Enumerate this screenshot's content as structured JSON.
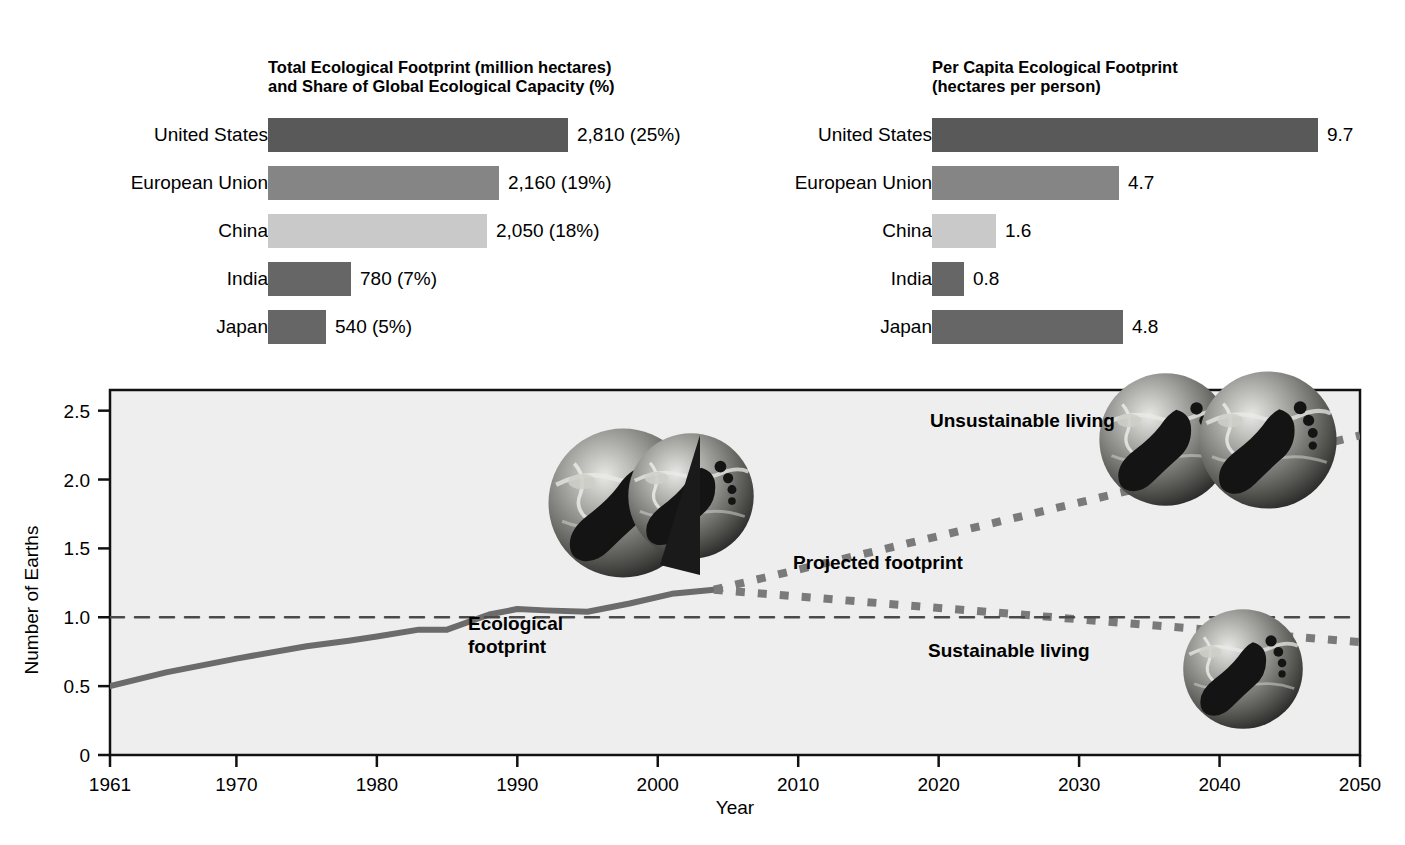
{
  "left_panel": {
    "title": "Total Ecological Footprint (million hectares)\nand Share of Global Ecological Capacity (%)",
    "rows": [
      {
        "label": "United States",
        "value_text": "2,810 (25%)",
        "value": 2810,
        "share_pct": 25,
        "color": "#595959"
      },
      {
        "label": "European Union",
        "value_text": "2,160 (19%)",
        "value": 2160,
        "share_pct": 19,
        "color": "#858585"
      },
      {
        "label": "China",
        "value_text": "2,050 (18%)",
        "value": 2050,
        "share_pct": 18,
        "color": "#c9c9c9"
      },
      {
        "label": "India",
        "value_text": "780 (7%)",
        "value": 780,
        "share_pct": 7,
        "color": "#666666"
      },
      {
        "label": "Japan",
        "value_text": "540 (5%)",
        "value": 540,
        "share_pct": 5,
        "color": "#666666"
      }
    ]
  },
  "right_panel": {
    "title": "Per Capita Ecological Footprint\n(hectares per person)",
    "rows": [
      {
        "label": "United States",
        "value_text": "9.7",
        "value": 9.7,
        "color": "#595959"
      },
      {
        "label": "European Union",
        "value_text": "4.7",
        "value": 4.7,
        "color": "#858585"
      },
      {
        "label": "China",
        "value_text": "1.6",
        "value": 1.6,
        "color": "#c9c9c9"
      },
      {
        "label": "India",
        "value_text": "0.8",
        "value": 0.8,
        "color": "#666666"
      },
      {
        "label": "Japan",
        "value_text": "4.8",
        "value": 4.8,
        "color": "#666666"
      }
    ]
  },
  "line_chart": {
    "ylabel": "Number of Earths",
    "xlabel": "Year",
    "yticks": [
      "0",
      "0.5",
      "1.0",
      "1.5",
      "2.0",
      "2.5"
    ],
    "ytick_values": [
      0,
      0.5,
      1.0,
      1.5,
      2.0,
      2.5
    ],
    "xticks": [
      "1961",
      "1970",
      "1980",
      "1990",
      "2000",
      "2010",
      "2020",
      "2030",
      "2040",
      "2050"
    ],
    "xtick_values": [
      1961,
      1970,
      1980,
      1990,
      2000,
      2010,
      2020,
      2030,
      2040,
      2050
    ],
    "annotations": {
      "unsustainable": "Unsustainable living",
      "projected": "Projected footprint",
      "sustainable": "Sustainable living",
      "ecological_footprint": "Ecological\nfootprint"
    },
    "capacity_line_value": 1.0
  },
  "chart_data": [
    {
      "type": "bar",
      "title": "Total Ecological Footprint (million hectares) and Share of Global Ecological Capacity (%)",
      "orientation": "horizontal",
      "categories": [
        "United States",
        "European Union",
        "China",
        "India",
        "Japan"
      ],
      "values": [
        2810,
        2160,
        2050,
        780,
        540
      ],
      "data_labels": [
        "2,810 (25%)",
        "2,160 (19%)",
        "2,050 (18%)",
        "780 (7%)",
        "540 (5%)"
      ],
      "share_percent": [
        25,
        19,
        18,
        7,
        5
      ],
      "unit": "million hectares",
      "xlabel": "",
      "ylabel": "",
      "xlim": [
        0,
        2810
      ],
      "grid": false,
      "legend": "none"
    },
    {
      "type": "bar",
      "title": "Per Capita Ecological Footprint (hectares per person)",
      "orientation": "horizontal",
      "categories": [
        "United States",
        "European Union",
        "China",
        "India",
        "Japan"
      ],
      "values": [
        9.7,
        4.7,
        1.6,
        0.8,
        4.8
      ],
      "data_labels": [
        "9.7",
        "4.7",
        "1.6",
        "0.8",
        "4.8"
      ],
      "unit": "hectares per person",
      "xlabel": "",
      "ylabel": "",
      "xlim": [
        0,
        9.7
      ],
      "grid": false,
      "legend": "none"
    },
    {
      "type": "line",
      "title": "",
      "xlabel": "Year",
      "ylabel": "Number of Earths",
      "xlim": [
        1961,
        2050
      ],
      "ylim": [
        0,
        2.65
      ],
      "grid": false,
      "legend": "none",
      "series": [
        {
          "name": "Ecological footprint",
          "style": "solid",
          "x": [
            1961,
            1965,
            1970,
            1975,
            1978,
            1980,
            1983,
            1985,
            1988,
            1990,
            1992,
            1995,
            1998,
            2001,
            2004
          ],
          "y": [
            0.5,
            0.6,
            0.7,
            0.79,
            0.83,
            0.86,
            0.91,
            0.91,
            1.02,
            1.06,
            1.05,
            1.04,
            1.1,
            1.17,
            1.2
          ]
        },
        {
          "name": "Unsustainable living (projected)",
          "style": "dotted",
          "x": [
            2004,
            2050
          ],
          "y": [
            1.2,
            2.32
          ]
        },
        {
          "name": "Sustainable living (projected)",
          "style": "dotted",
          "x": [
            2004,
            2050
          ],
          "y": [
            1.2,
            0.82
          ]
        },
        {
          "name": "Global ecological capacity",
          "style": "dashed",
          "x": [
            1961,
            2050
          ],
          "y": [
            1.0,
            1.0
          ]
        }
      ]
    }
  ]
}
